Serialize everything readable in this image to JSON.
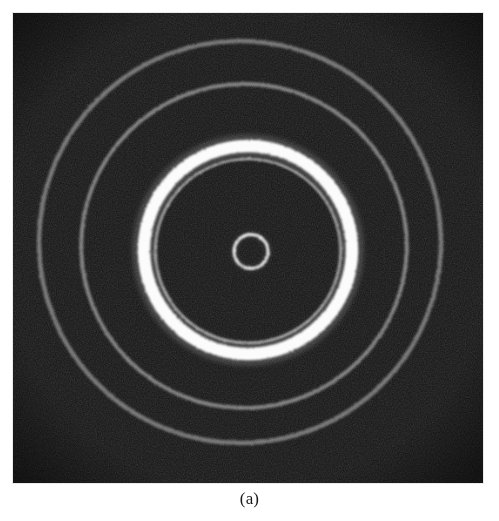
{
  "figure": {
    "caption": "(a)",
    "panel_label": "(a)",
    "kind": "electron-diffraction-ring-pattern",
    "image_region": {
      "x": 13,
      "y": 13,
      "width": 470,
      "height": 470
    },
    "background_color": "#ffffff",
    "plate_color": "#050505"
  },
  "chart_data": {
    "type": "scatter",
    "title": "",
    "subtitle": "",
    "xlabel": "",
    "ylabel": "",
    "grid": false,
    "legend": null,
    "annotations": [
      "(a)"
    ],
    "pattern_center": {
      "x": 237,
      "y": 237
    },
    "rings": [
      {
        "index": 1,
        "name": "central-transmitted-beam-ring",
        "radius": 17,
        "thickness": 2.4,
        "brightness": 0.95,
        "color": "#f2f2f2",
        "center_dx": 1.0,
        "center_dy": 1.5,
        "eccentricity": 1.0,
        "sharpness": 0.55
      },
      {
        "index": 2,
        "name": "inner-companion-ring",
        "radius": 92,
        "thickness": 2.0,
        "brightness": 0.7,
        "color": "#c9c9c9",
        "center_dx": -2.0,
        "center_dy": 1.0,
        "eccentricity": 1.01,
        "sharpness": 1.1
      },
      {
        "index": 3,
        "name": "principal-bright-ring",
        "radius": 104,
        "thickness": 12.5,
        "brightness": 1.0,
        "color": "#fbfbfb",
        "center_dx": -2.0,
        "center_dy": 0.0,
        "eccentricity": 1.0,
        "sharpness": 2.6
      },
      {
        "index": 4,
        "name": "middle-ring",
        "radius": 162,
        "thickness": 4.0,
        "brightness": 0.62,
        "color": "#b6b6b6",
        "center_dx": -6.0,
        "center_dy": -4.0,
        "eccentricity": 1.005,
        "sharpness": 2.0
      },
      {
        "index": 5,
        "name": "outer-ring",
        "radius": 201,
        "thickness": 4.5,
        "brightness": 0.58,
        "color": "#adadad",
        "center_dx": -10.0,
        "center_dy": -8.0,
        "eccentricity": 1.0,
        "sharpness": 2.2
      }
    ],
    "noise": {
      "type": "film-grain",
      "amount": 0.22,
      "seed": 20250614
    }
  }
}
